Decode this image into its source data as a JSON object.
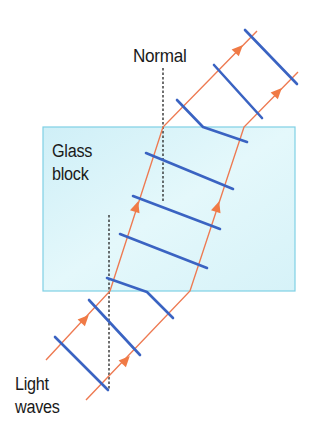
{
  "labels": {
    "normal": "Normal",
    "glass_line1": "Glass",
    "glass_line2": "block",
    "light_line1": "Light",
    "light_line2": "waves"
  },
  "colors": {
    "glass_fill": "#d9f4f9",
    "glass_border": "#7fd0e4",
    "ray": "#ee7a52",
    "wavefront": "#3a63c2",
    "normal_line": "#222222"
  },
  "geometry": {
    "glass_block": {
      "x": 43,
      "y": 127,
      "width": 252,
      "height": 164
    },
    "normal_upper": {
      "x": 163,
      "y1": 68,
      "y2": 202
    },
    "normal_lower": {
      "x": 109,
      "y1": 215,
      "y2": 390
    },
    "rays": [
      {
        "points": "46,360 110,291 163,127 257,31"
      },
      {
        "points": "86,400 190,291 244,127 298,72"
      }
    ],
    "wavefronts": [
      "55,337 108,390",
      "89,300 140,355",
      "107,278 147,292 173,318",
      "120,234 207,268",
      "133,196 220,229",
      "146,153 233,189",
      "177,100 203,127 247,142",
      "214,65 262,118",
      "245,30 297,84"
    ]
  }
}
